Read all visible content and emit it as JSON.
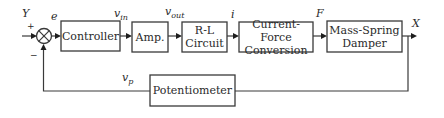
{
  "diagram": {
    "type": "closed-loop control block diagram",
    "colors": {
      "stroke": "#3a3a3a",
      "background": "#ffffff",
      "text": "#2a2a2a"
    },
    "summing_junction": {
      "symbol": "⊗",
      "plus_sign": "+",
      "minus_sign": "−"
    },
    "blocks": [
      {
        "id": "controller",
        "label": "Controller"
      },
      {
        "id": "amp",
        "label": "Amp."
      },
      {
        "id": "rl",
        "label_line1": "R-L",
        "label_line2": "Circuit"
      },
      {
        "id": "cfc",
        "label_line1": "Current-Force",
        "label_line2": "Conversion"
      },
      {
        "id": "msd",
        "label_line1": "Mass-Spring",
        "label_line2": "Damper"
      },
      {
        "id": "pot",
        "label": "Potentiometer"
      }
    ],
    "signals": {
      "input": "Y",
      "error": "e",
      "vin_base": "v",
      "vin_sub": "in",
      "vout_base": "v",
      "vout_sub": "out",
      "current": "i",
      "force": "F",
      "output": "X",
      "vp_base": "v",
      "vp_sub": "p"
    }
  }
}
